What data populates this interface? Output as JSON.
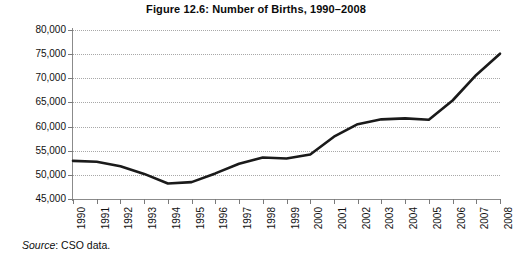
{
  "chart_data": {
    "type": "line",
    "title": "Figure 12.6: Number of Births, 1990–2008",
    "xlabel": "",
    "ylabel": "",
    "ylim": [
      45000,
      80000
    ],
    "ytick_step": 5000,
    "ytick_labels": [
      "80,000",
      "75,000",
      "70,000",
      "65,000",
      "60,000",
      "55,000",
      "50,000",
      "45,000"
    ],
    "ytick_values": [
      80000,
      75000,
      70000,
      65000,
      60000,
      55000,
      50000,
      45000
    ],
    "grid": true,
    "grid_axis": "y",
    "legend": false,
    "categories": [
      "1990",
      "1991",
      "1992",
      "1993",
      "1994",
      "1995",
      "1996",
      "1997",
      "1998",
      "1999",
      "2000",
      "2001",
      "2002",
      "2003",
      "2004",
      "2005",
      "2006",
      "2007",
      "2008"
    ],
    "x": [
      1990,
      1991,
      1992,
      1993,
      1994,
      1995,
      1996,
      1997,
      1998,
      1999,
      2000,
      2001,
      2002,
      2003,
      2004,
      2005,
      2006,
      2007,
      2008
    ],
    "values": [
      52900,
      52700,
      51800,
      50200,
      48200,
      48500,
      50300,
      52300,
      53600,
      53400,
      54200,
      57900,
      60500,
      61500,
      61700,
      61400,
      65400,
      70700,
      75100
    ],
    "series": [
      {
        "name": "Number of Births",
        "color": "#1a1a1a",
        "line_width": 2.6,
        "values": [
          52900,
          52700,
          51800,
          50200,
          48200,
          48500,
          50300,
          52300,
          53600,
          53400,
          54200,
          57900,
          60500,
          61500,
          61700,
          61400,
          65400,
          70700,
          75100
        ]
      }
    ],
    "annotations": []
  },
  "source": {
    "label": "Source",
    "text": ": CSO data."
  },
  "colors": {
    "line": "#1a1a1a",
    "grid": "#a8a8a8",
    "axis": "#8b8b8b",
    "text": "#111111",
    "background": "#ffffff"
  }
}
